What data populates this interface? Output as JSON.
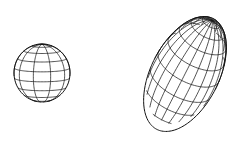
{
  "canvas": {
    "width": 248,
    "height": 155,
    "background": "#ffffff",
    "stroke": "#1a1a1a"
  },
  "shapes": [
    {
      "id": "sphere",
      "label": "wireframe sphere",
      "cx": 42,
      "cy": 73,
      "rx": 28,
      "ry": 29,
      "tilt_deg": 0,
      "view_pitch_deg": 8,
      "meridians": 10,
      "parallels": 9
    },
    {
      "id": "ellipsoid",
      "label": "wireframe ellipsoid",
      "cx": 185,
      "cy": 74,
      "a": 34,
      "b": 34,
      "c": 68,
      "tilt_deg": 27,
      "view_pitch_deg": 28,
      "meridians": 20,
      "parallels": 11
    }
  ]
}
